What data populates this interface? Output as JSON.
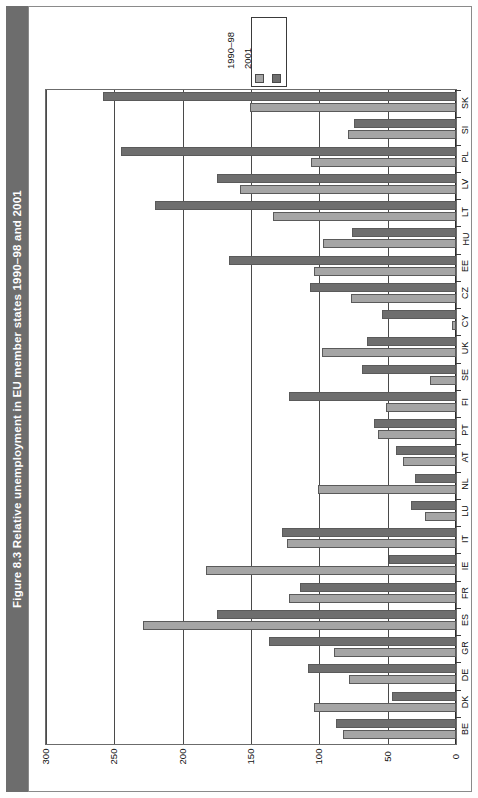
{
  "figure": {
    "title": "Figure 8.3  Relative unemployment in EU member states 1990–98 and 2001"
  },
  "legend": {
    "position": "top-center",
    "entries": [
      {
        "label": "1990–98",
        "color": "#a5a5a5",
        "name": "legend-series-1990-98"
      },
      {
        "label": "2001",
        "color": "#6e6e6e",
        "name": "legend-series-2001"
      }
    ]
  },
  "axis": {
    "value_ticks": [
      "300",
      "250",
      "200",
      "150",
      "100",
      "50",
      "0"
    ],
    "value_min": 0,
    "value_max": 300,
    "direction": "right-to-left"
  },
  "chart_data": {
    "type": "bar",
    "title": "Figure 8.3  Relative unemployment in EU member states 1990–98 and 2001",
    "xlabel": "",
    "ylabel": "",
    "orientation": "horizontal",
    "grid": true,
    "legend_position": "top",
    "xlim": [
      0,
      300
    ],
    "categories": [
      "BE",
      "DK",
      "DE",
      "GR",
      "ES",
      "FR",
      "IE",
      "IT",
      "LU",
      "NL",
      "AT",
      "PT",
      "FI",
      "SE",
      "UK",
      "CY",
      "CZ",
      "EE",
      "HU",
      "LT",
      "LV",
      "PL",
      "SI",
      "SK"
    ],
    "series": [
      {
        "name": "1990–98",
        "color": "#a5a5a5",
        "values": [
          83,
          104,
          78,
          89,
          229,
          122,
          183,
          124,
          23,
          101,
          39,
          57,
          51,
          19,
          98,
          3,
          77,
          104,
          97,
          134,
          158,
          106,
          79,
          151
        ]
      },
      {
        "name": "2001",
        "color": "#6e6e6e",
        "values": [
          88,
          47,
          108,
          137,
          175,
          114,
          49,
          127,
          33,
          30,
          44,
          60,
          122,
          69,
          65,
          54,
          107,
          166,
          76,
          220,
          175,
          245,
          75,
          258
        ]
      }
    ]
  }
}
